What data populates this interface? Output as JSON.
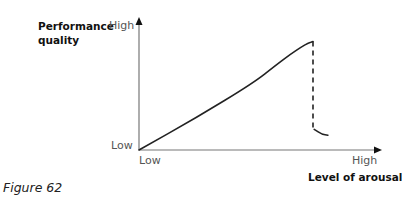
{
  "chart_data": {
    "type": "line",
    "title": "",
    "caption": "Figure 62",
    "xlabel": "Level of arousal",
    "ylabel": "Performance quality",
    "x_ticks": {
      "low": "Low",
      "high": "High"
    },
    "y_ticks": {
      "low": "Low",
      "high": "High"
    },
    "xlim": [
      0,
      1
    ],
    "ylim": [
      0,
      1
    ],
    "grid": false,
    "series": [
      {
        "name": "performance-rise",
        "style": "solid",
        "points": [
          [
            0,
            0
          ],
          [
            0.25,
            0.25
          ],
          [
            0.5,
            0.52
          ],
          [
            0.6,
            0.66
          ],
          [
            0.66,
            0.74
          ],
          [
            0.71,
            0.8
          ],
          [
            0.74,
            0.83
          ],
          [
            0.76,
            0.84
          ]
        ]
      },
      {
        "name": "catastrophic-drop",
        "style": "dashed",
        "points": [
          [
            0.76,
            0.84
          ],
          [
            0.76,
            0.17
          ]
        ]
      },
      {
        "name": "post-drop-tail",
        "style": "solid",
        "points": [
          [
            0.765,
            0.16
          ],
          [
            0.8,
            0.12
          ],
          [
            0.825,
            0.115
          ]
        ]
      }
    ]
  }
}
